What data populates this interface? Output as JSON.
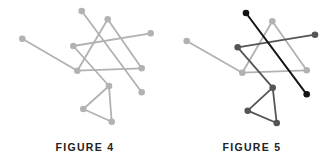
{
  "colors": {
    "light": "#b2b2b2",
    "dark": "#555555",
    "black": "#141414",
    "label": "#222222"
  },
  "figures": [
    {
      "id": "figure-4",
      "label": "FIGURE 4",
      "label_pos": [
        85,
        141
      ],
      "nodes": {
        "a": [
          81.7,
          11
        ],
        "b": [
          107.7,
          19.3
        ],
        "c": [
          150.7,
          33.3
        ],
        "d": [
          22.3,
          38.7
        ],
        "e": [
          73.3,
          46
        ],
        "f": [
          77.3,
          70.7
        ],
        "g": [
          141.7,
          68.3
        ],
        "h": [
          141.7,
          92.3
        ],
        "i": [
          109,
          86
        ],
        "j": [
          83.3,
          109
        ],
        "k": [
          111.7,
          121.7
        ]
      },
      "edges": [
        {
          "from": "d",
          "to": "f",
          "color": "light"
        },
        {
          "from": "f",
          "to": "b",
          "color": "light"
        },
        {
          "from": "b",
          "to": "g",
          "color": "light"
        },
        {
          "from": "g",
          "to": "f",
          "color": "light"
        },
        {
          "from": "a",
          "to": "h",
          "color": "light"
        },
        {
          "from": "c",
          "to": "e",
          "color": "light"
        },
        {
          "from": "e",
          "to": "i",
          "color": "light"
        },
        {
          "from": "i",
          "to": "j",
          "color": "light"
        },
        {
          "from": "j",
          "to": "k",
          "color": "light"
        },
        {
          "from": "k",
          "to": "i",
          "color": "light"
        }
      ]
    },
    {
      "id": "figure-5",
      "label": "FIGURE 5",
      "label_pos": [
        252,
        141
      ],
      "nodes": {
        "a": [
          246,
          13
        ],
        "b": [
          272.3,
          21.3
        ],
        "c": [
          315,
          34.7
        ],
        "d": [
          186.7,
          41
        ],
        "e": [
          237.7,
          47.3
        ],
        "f": [
          242.3,
          72.7
        ],
        "g": [
          306.7,
          70.3
        ],
        "h": [
          306.7,
          94.3
        ],
        "i": [
          272.7,
          87.7
        ],
        "j": [
          247.7,
          110.7
        ],
        "k": [
          276.7,
          123
        ]
      },
      "edges": [
        {
          "from": "d",
          "to": "f",
          "color": "light"
        },
        {
          "from": "f",
          "to": "b",
          "color": "light"
        },
        {
          "from": "b",
          "to": "g",
          "color": "light"
        },
        {
          "from": "g",
          "to": "f",
          "color": "light"
        },
        {
          "from": "c",
          "to": "e",
          "color": "dark"
        },
        {
          "from": "e",
          "to": "i",
          "color": "dark"
        },
        {
          "from": "i",
          "to": "j",
          "color": "dark"
        },
        {
          "from": "j",
          "to": "k",
          "color": "dark"
        },
        {
          "from": "k",
          "to": "i",
          "color": "dark"
        },
        {
          "from": "a",
          "to": "h",
          "color": "black"
        }
      ],
      "node_colors": {
        "a": "black",
        "h": "black",
        "b": "light",
        "d": "light",
        "f": "light",
        "g": "light",
        "c": "dark",
        "e": "dark",
        "i": "dark",
        "j": "dark",
        "k": "dark"
      }
    }
  ]
}
